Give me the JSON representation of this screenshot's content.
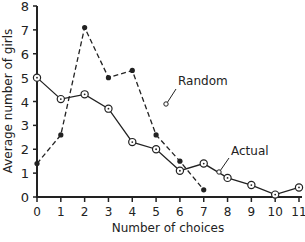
{
  "chart_data": {
    "type": "line",
    "title": "",
    "xlabel": "Number of choices",
    "ylabel": "Average number of girls",
    "xlim": [
      0,
      11
    ],
    "ylim": [
      0,
      8
    ],
    "x_ticks": [
      0,
      1,
      2,
      3,
      4,
      5,
      6,
      7,
      8,
      9,
      10,
      11
    ],
    "y_ticks": [
      0,
      1,
      2,
      3,
      4,
      5,
      6,
      7,
      8
    ],
    "grid": false,
    "legend_position": "inline annotations",
    "series": [
      {
        "name": "Random",
        "style": "dashed",
        "marker": "filled-circle",
        "x": [
          0,
          1,
          2,
          3,
          4,
          5,
          6,
          7
        ],
        "values": [
          1.4,
          2.6,
          7.1,
          5.0,
          5.3,
          2.6,
          1.5,
          0.3
        ]
      },
      {
        "name": "Actual",
        "style": "solid",
        "marker": "open-circle-dot",
        "x": [
          0,
          1,
          2,
          3,
          4,
          5,
          6,
          7,
          8,
          9,
          10,
          11
        ],
        "values": [
          5.0,
          4.1,
          4.3,
          3.7,
          2.3,
          2.0,
          1.1,
          1.4,
          0.8,
          0.5,
          0.1,
          0.4
        ]
      }
    ],
    "annotations": [
      {
        "text": "Random",
        "points_to_series": "Random"
      },
      {
        "text": "Actual",
        "points_to_series": "Actual"
      }
    ]
  },
  "labels": {
    "xlabel": "Number of choices",
    "ylabel": "Average number of girls",
    "random": "Random",
    "actual": "Actual"
  },
  "colors": {
    "line": "#222222",
    "background": "#ffffff"
  }
}
